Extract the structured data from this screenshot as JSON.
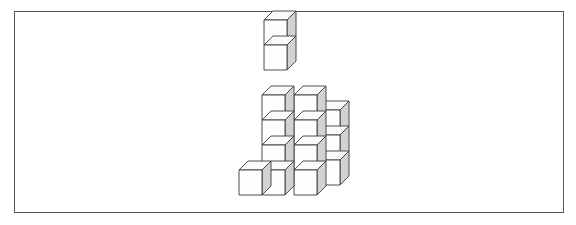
{
  "page": {
    "background_color": "#ffffff",
    "width": 576,
    "height": 225
  },
  "frame": {
    "name": "figure-border",
    "x": 14,
    "y": 11,
    "width": 550,
    "height": 202,
    "stroke_color": "#555555",
    "stroke_width": 1,
    "fill_color": "#ffffff"
  },
  "figure": {
    "name": "cube-stack-drawing",
    "projection": "isometric",
    "cube_count": 14,
    "colors": {
      "front_face": "#fefefe",
      "side_face": "#d2d2d2",
      "top_face": "#fbfbfb",
      "edge_stroke": "#3a3a3a"
    },
    "geometry": {
      "cube_width": 23,
      "cube_height": 25,
      "depth_dx": 9,
      "depth_dy": -9,
      "origin_x": 239,
      "origin_y": 195
    },
    "columns": [
      {
        "name": "front-left-column",
        "grid_x": 0,
        "grid_z": 0,
        "height": 1
      },
      {
        "name": "front-middle-column",
        "grid_x": 1,
        "grid_z": 0,
        "height": 4
      },
      {
        "name": "front-right-column",
        "grid_x": 2,
        "grid_z": 0,
        "height": 3
      },
      {
        "name": "back-left-column",
        "grid_x": 1,
        "grid_z": 1,
        "height": 3
      },
      {
        "name": "back-right-column",
        "grid_x": 2,
        "grid_z": 1,
        "height": 3
      }
    ],
    "cubes": [
      {
        "id": "c1",
        "col": "front-left-column",
        "level": 1,
        "fx": 239,
        "fy": 170
      },
      {
        "id": "c2",
        "col": "front-middle-column",
        "level": 1,
        "fx": 262,
        "fy": 170
      },
      {
        "id": "c3",
        "col": "front-middle-column",
        "level": 2,
        "fx": 262,
        "fy": 145
      },
      {
        "id": "c4",
        "col": "front-middle-column",
        "level": 3,
        "fx": 262,
        "fy": 120
      },
      {
        "id": "c5",
        "col": "front-middle-column",
        "level": 4,
        "fx": 262,
        "fy": 95
      },
      {
        "id": "c6",
        "col": "tower-top",
        "level": 5,
        "fx": 264,
        "fy": 45
      },
      {
        "id": "c7",
        "col": "tower-top",
        "level": 6,
        "fx": 264,
        "fy": 20
      },
      {
        "id": "c8",
        "col": "front-right-column",
        "level": 1,
        "fx": 294,
        "fy": 170
      },
      {
        "id": "c9",
        "col": "front-right-column",
        "level": 2,
        "fx": 294,
        "fy": 145
      },
      {
        "id": "c10",
        "col": "front-right-column",
        "level": 3,
        "fx": 294,
        "fy": 120
      },
      {
        "id": "c11",
        "col": "front-right-column",
        "level": 4,
        "fx": 294,
        "fy": 95
      },
      {
        "id": "c12",
        "col": "back-right-column",
        "level": 1,
        "fx": 317,
        "fy": 160
      },
      {
        "id": "c13",
        "col": "back-right-column",
        "level": 2,
        "fx": 317,
        "fy": 135
      },
      {
        "id": "c14",
        "col": "back-right-column",
        "level": 3,
        "fx": 317,
        "fy": 110
      }
    ]
  }
}
